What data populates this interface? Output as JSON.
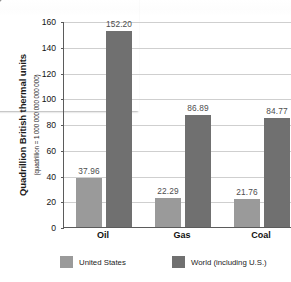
{
  "page": {
    "frame_color": "#8d8d8d",
    "background": "#ffffff"
  },
  "chart_data": {
    "type": "bar",
    "title": "",
    "subtitle": "",
    "xlabel": "",
    "ylabel": "Quadrillion British thermal units",
    "ylabel_note": "(quadrillion = 1 000 000 000 000 000)",
    "categories": [
      "Oil",
      "Gas",
      "Coal"
    ],
    "series": [
      {
        "name": "United States",
        "color": "#9a9a9a",
        "values": [
          37.96,
          22.29,
          21.76
        ],
        "labels": [
          "37.96",
          "22.29",
          "21.76"
        ]
      },
      {
        "name": "World (including U.S.)",
        "color": "#707070",
        "values": [
          152.2,
          86.89,
          84.77
        ],
        "labels": [
          "152.20",
          "86.89",
          "84.77"
        ]
      }
    ],
    "ylim": [
      0,
      160
    ],
    "ytick_step": 20,
    "yticks": [
      0,
      20,
      40,
      60,
      80,
      100,
      120,
      140,
      160
    ],
    "ytick_labels": [
      "0",
      "20",
      "40",
      "60",
      "80",
      "100",
      "120",
      "140",
      "160"
    ],
    "grid": true,
    "grid_color": "#cfcfcf",
    "axis_color": "#5b5b5b",
    "legend_position": "bottom",
    "legend": [
      "United States",
      "World (including U.S.)"
    ]
  }
}
